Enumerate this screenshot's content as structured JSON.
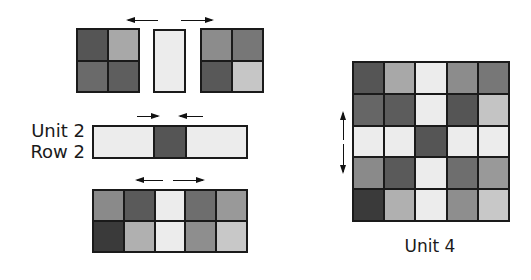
{
  "labels": {
    "unit2_line1": "Unit 2",
    "unit2_line2": "Row 2",
    "unit4": "Unit 4"
  },
  "colors": {
    "border": "#1a1a1a",
    "very_light": "#ececec",
    "light": "#b0b0b0",
    "light2": "#c6c6c6",
    "mid": "#8c8c8c",
    "mid_dark": "#6e6e6e",
    "dark": "#585858",
    "darkest": "#3a3a3a"
  },
  "row1": {
    "left_block": [
      [
        "#555555",
        "#a8a8a8"
      ],
      [
        "#6a6a6a",
        "#5e5e5e"
      ]
    ],
    "center_strip": "#ececec",
    "right_block": [
      [
        "#8c8c8c",
        "#777777"
      ],
      [
        "#585858",
        "#c6c6c6"
      ]
    ],
    "arrows": [
      "left",
      "right"
    ]
  },
  "row2": {
    "cells": [
      "#ececec",
      "#555555",
      "#ececec"
    ],
    "arrows": [
      "right",
      "left"
    ]
  },
  "row3": {
    "cells": [
      [
        "#8a8a8a",
        "#5a5a5a",
        "#ececec",
        "#6e6e6e",
        "#999999"
      ],
      [
        "#3a3a3a",
        "#b0b0b0",
        "#ececec",
        "#8e8e8e",
        "#c8c8c8"
      ]
    ],
    "arrows": [
      "left",
      "right"
    ]
  },
  "unit4": {
    "grid": [
      [
        "#555555",
        "#a8a8a8",
        "#ececec",
        "#8c8c8c",
        "#777777"
      ],
      [
        "#666666",
        "#5c5c5c",
        "#ececec",
        "#555555",
        "#c4c4c4"
      ],
      [
        "#ececec",
        "#ececec",
        "#555555",
        "#ececec",
        "#ececec"
      ],
      [
        "#8a8a8a",
        "#5a5a5a",
        "#ececec",
        "#6e6e6e",
        "#999999"
      ],
      [
        "#3a3a3a",
        "#b0b0b0",
        "#ececec",
        "#8e8e8e",
        "#c8c8c8"
      ]
    ],
    "arrows": [
      "up",
      "down"
    ]
  }
}
